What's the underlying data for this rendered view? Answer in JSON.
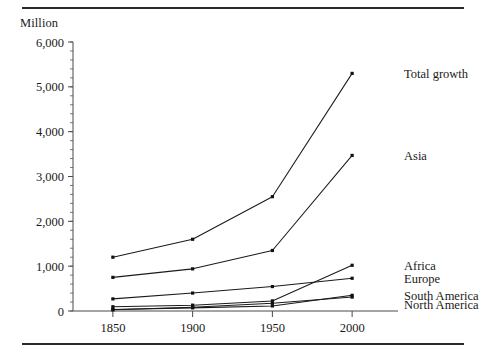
{
  "figure": {
    "unit_label": "Million",
    "top_rule": true,
    "bottom_rule": true
  },
  "chart_data": {
    "type": "line",
    "title": "",
    "subtitle": "",
    "xlabel": "",
    "ylabel": "Million",
    "x": [
      1850,
      1900,
      1950,
      2000
    ],
    "xtick_labels": [
      "1850",
      "1900",
      "1950",
      "2000"
    ],
    "ytick_labels": [
      "0",
      "1,000",
      "2,000",
      "3,000",
      "4,000",
      "5,000",
      "6,000"
    ],
    "ytick_values": [
      0,
      1000,
      2000,
      3000,
      4000,
      5000,
      6000
    ],
    "yminor_step": 200,
    "xlim": [
      1825,
      2025
    ],
    "ylim": [
      0,
      6000
    ],
    "grid": false,
    "legend_position": "right-inline-labels",
    "line_color": "#1a1a1a",
    "marker": "square",
    "series": [
      {
        "name": "Total growth",
        "label": "Total growth",
        "values": [
          1200,
          1600,
          2550,
          5300
        ]
      },
      {
        "name": "Asia",
        "label": "Asia",
        "values": [
          750,
          940,
          1350,
          3470
        ]
      },
      {
        "name": "Africa",
        "label": "Africa",
        "values": [
          95,
          130,
          225,
          1020
        ]
      },
      {
        "name": "Europe",
        "label": "Europe",
        "values": [
          270,
          400,
          545,
          730
        ]
      },
      {
        "name": "South America",
        "label": "South America",
        "values": [
          33,
          70,
          113,
          350
        ]
      },
      {
        "name": "North America",
        "label": "North America",
        "values": [
          26,
          82,
          172,
          310
        ]
      }
    ],
    "label_anchors": {
      "Total growth": {
        "value": 5300
      },
      "Asia": {
        "value": 3470
      },
      "Africa": {
        "value": 1020
      },
      "Europe": {
        "value": 730
      },
      "South America": {
        "value": 350
      },
      "North America": {
        "value": 150
      }
    }
  }
}
